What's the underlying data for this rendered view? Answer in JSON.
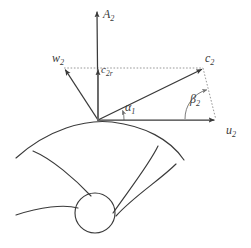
{
  "figure": {
    "kind": "velocity-triangle-diagram",
    "background_color": "#ffffff",
    "line_color": "#3a3a3a",
    "dotted_color": "#8c8c8c"
  },
  "labels": {
    "axis_vertical": {
      "base": "A",
      "sub": "2"
    },
    "relative_velocity": {
      "base": "w",
      "sub": "2"
    },
    "radial_component": {
      "base": "c",
      "sub": "2r"
    },
    "absolute_velocity": {
      "base": "c",
      "sub": "2"
    },
    "blade_velocity": {
      "base": "u",
      "sub": "2"
    },
    "angle_alpha": {
      "base": "α",
      "sub": "1"
    },
    "angle_beta": {
      "base": "β",
      "sub": "2"
    }
  },
  "geometry": {
    "origin": {
      "x": 98,
      "y": 120
    },
    "vectors": [
      {
        "name": "A2",
        "tip_x": 97,
        "tip_y": 10,
        "style": "solid-arrow"
      },
      {
        "name": "u2",
        "tip_x": 216,
        "tip_y": 120,
        "style": "solid-arrow"
      },
      {
        "name": "c2",
        "tip_x": 203,
        "tip_y": 68,
        "style": "solid-arrow"
      },
      {
        "name": "w2",
        "tip_x": 64,
        "tip_y": 68,
        "style": "solid-arrow"
      },
      {
        "name": "c2r",
        "tip_x": 98,
        "tip_y": 68,
        "style": "solid-arrow"
      }
    ],
    "construction_lines": [
      {
        "name": "w2-to-c2-horizontal",
        "x1": 64,
        "y1": 68,
        "x2": 203,
        "y2": 68,
        "style": "dotted"
      },
      {
        "name": "c2-to-u2-closing",
        "x1": 203,
        "y1": 68,
        "x2": 215,
        "y2": 119,
        "style": "dotted"
      }
    ],
    "angle_arcs": [
      {
        "name": "alpha1",
        "center_x": 98,
        "center_y": 120,
        "radius": 26,
        "style": "solid"
      },
      {
        "name": "beta2",
        "center_x": 215,
        "center_y": 119,
        "radius": 30,
        "style": "solid"
      }
    ],
    "impeller": {
      "hub_circle": {
        "cx": 95,
        "cy": 213,
        "r": 20
      },
      "outer_arc": "sweeping arc from lower-left to right below origin",
      "blade_count": 2
    }
  }
}
